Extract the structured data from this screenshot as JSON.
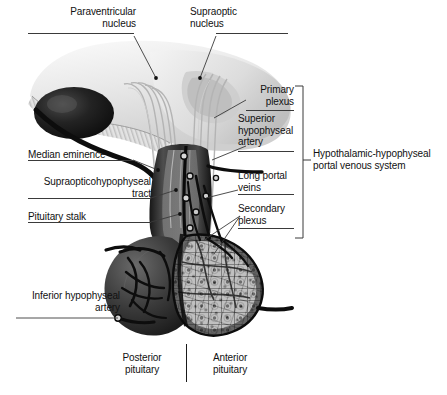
{
  "figure": {
    "title": "Hypothalamic-hypophyseal portal venous system",
    "palette": {
      "background": "#ffffff",
      "text": "#111111",
      "leader_line": "#3a3a3a",
      "hypothalamus_light": "#ededed",
      "optic_chiasm_dark": "#1b1b1b",
      "posterior_pituitary": "#3d3d3d",
      "anterior_pituitary_cells": "#b9b9b9",
      "vessel_dark": "#101010"
    }
  },
  "labels": {
    "paraventricular_nucleus": "Paraventricular\nnucleus",
    "supraoptic_nucleus": "Supraoptic\nnucleus",
    "median_eminence": "Median eminence",
    "supraopticohypophyseal_tract": "Supraopticohypophyseal\ntract",
    "pituitary_stalk": "Pituitary stalk",
    "inferior_hypophyseal_artery": "Inferior hypophyseal\nartery",
    "primary_plexus": "Primary\nplexus",
    "superior_hypophyseal_artery": "Superior\nhypophyseal\nartery",
    "long_portal_veins": "Long portal\nveins",
    "secondary_plexus": "Secondary\nplexus",
    "portal_venous_system": "Hypothalamic-hypophyseal\nportal venous system",
    "posterior_pituitary": "Posterior\npituitary",
    "anterior_pituitary": "Anterior\npituitary"
  }
}
